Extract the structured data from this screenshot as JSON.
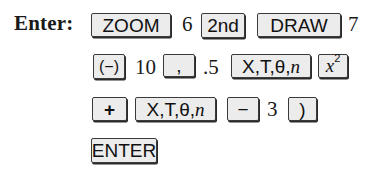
{
  "instruction": {
    "label": "Enter:"
  },
  "rows": [
    {
      "items": [
        {
          "type": "key",
          "label": "ZOOM"
        },
        {
          "type": "text",
          "value": "6"
        },
        {
          "type": "key",
          "label": "2nd"
        },
        {
          "type": "key",
          "label": "DRAW"
        },
        {
          "type": "text",
          "value": "7"
        }
      ]
    },
    {
      "items": [
        {
          "type": "key",
          "label": "(−)"
        },
        {
          "type": "text",
          "value": "10"
        },
        {
          "type": "key",
          "label": ","
        },
        {
          "type": "text",
          "value": ".5"
        },
        {
          "type": "key",
          "label": "X,T,θ,n"
        },
        {
          "type": "key",
          "label": "x²"
        }
      ]
    },
    {
      "items": [
        {
          "type": "key",
          "label": "+"
        },
        {
          "type": "key",
          "label": "X,T,θ,n"
        },
        {
          "type": "key",
          "label": "−"
        },
        {
          "type": "text",
          "value": "3"
        },
        {
          "type": "key",
          "label": ")"
        }
      ]
    },
    {
      "items": [
        {
          "type": "key",
          "label": "ENTER"
        }
      ]
    }
  ],
  "keys": {
    "zoom": "ZOOM",
    "second": "2nd",
    "draw": "DRAW",
    "negative": "(−)",
    "comma": ",",
    "xt_var_1": "X,T,θ,",
    "xt_var_1_n": "n",
    "square_x": "x",
    "square_exp": "2",
    "plus": "+",
    "xt_var_2": "X,T,θ,",
    "xt_var_2_n": "n",
    "minus": "−",
    "close_paren": ")",
    "enter": "ENTER"
  },
  "values": {
    "six": "6",
    "seven": "7",
    "ten": "10",
    "half": ".5",
    "three": "3"
  }
}
